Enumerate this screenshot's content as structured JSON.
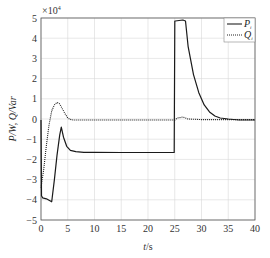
{
  "chart_data": {
    "type": "line",
    "title": "",
    "xlabel": "t/s",
    "ylabel": "P_i/W, Q_i/Var",
    "y_multiplier": "×10^4",
    "xlim": [
      0,
      40
    ],
    "ylim": [
      -5,
      5
    ],
    "x_ticks": [
      0,
      5,
      10,
      15,
      20,
      25,
      30,
      35,
      40
    ],
    "y_ticks": [
      -5,
      -4,
      -3,
      -2,
      -1,
      0,
      1,
      2,
      3,
      4,
      5
    ],
    "grid": true,
    "legend_position": "upper right",
    "series": [
      {
        "name": "P_i",
        "style": "solid",
        "x": [
          0,
          0.1,
          0.3,
          1.0,
          2.0,
          2.5,
          3.0,
          3.5,
          3.8,
          4.2,
          4.8,
          5.5,
          6.5,
          8,
          10,
          15,
          20,
          24.9,
          25.0,
          25.1,
          26.5,
          27.0,
          27.5,
          28.5,
          29.5,
          30.5,
          31.5,
          32.5,
          33.5,
          35,
          37,
          40
        ],
        "y": [
          -0.05,
          -3.8,
          -3.9,
          -3.95,
          -4.1,
          -3.0,
          -1.8,
          -0.8,
          -0.4,
          -0.9,
          -1.35,
          -1.55,
          -1.62,
          -1.65,
          -1.65,
          -1.66,
          -1.66,
          -1.66,
          4.85,
          4.85,
          4.9,
          4.85,
          3.6,
          2.2,
          1.3,
          0.7,
          0.35,
          0.15,
          0.05,
          0.0,
          -0.05,
          -0.05
        ]
      },
      {
        "name": "Q_i",
        "style": "dotted",
        "x": [
          0,
          0.5,
          1.0,
          1.5,
          2.0,
          2.5,
          3.0,
          3.5,
          4.0,
          4.5,
          5.0,
          5.5,
          6.0,
          7.0,
          10,
          15,
          20,
          25,
          25.5,
          26.5,
          27.5,
          30,
          35,
          40
        ],
        "y": [
          -3.4,
          -2.5,
          -1.3,
          -0.3,
          0.4,
          0.7,
          0.82,
          0.75,
          0.5,
          0.25,
          0.05,
          -0.02,
          -0.05,
          -0.05,
          -0.05,
          -0.05,
          -0.05,
          -0.05,
          0.05,
          0.1,
          0.0,
          -0.03,
          -0.03,
          -0.03
        ]
      }
    ]
  },
  "legend": {
    "entries": [
      {
        "label": "P",
        "sub": "i"
      },
      {
        "label": "Q",
        "sub": "i"
      }
    ]
  },
  "axes": {
    "xlabel_t": "t",
    "xlabel_unit": "/s",
    "ylabel_text": "P/W, Q/Var",
    "multiplier_base": "×10",
    "multiplier_exp": "4"
  }
}
